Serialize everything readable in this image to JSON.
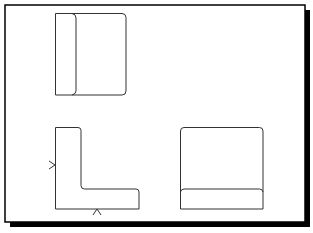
{
  "drawing": {
    "type": "orthographic-projection",
    "frame": {
      "x": 5,
      "y": 5,
      "width": 300,
      "height": 217,
      "shadow_offset": 5,
      "border_color": "#000000",
      "shadow_color": "#000000",
      "background": "#ffffff"
    },
    "line_color": "#333333",
    "views": [
      {
        "name": "top-view",
        "outline": {
          "x": 55,
          "y": 13,
          "width": 71,
          "height": 82
        },
        "divider_x": 75
      },
      {
        "name": "front-view",
        "shape": "L",
        "points": [
          [
            55,
            127
          ],
          [
            79,
            127
          ],
          [
            81,
            129
          ],
          [
            81,
            187
          ],
          [
            83,
            189
          ],
          [
            137,
            189
          ],
          [
            139,
            191
          ],
          [
            139,
            209
          ],
          [
            55,
            209
          ]
        ]
      },
      {
        "name": "side-view",
        "outline": {
          "x": 180,
          "y": 127,
          "width": 83,
          "height": 82
        },
        "divider_y": 189
      }
    ],
    "view_arrows": [
      {
        "name": "left-view-arrow",
        "direction": "right",
        "apex": [
          55,
          165
        ]
      },
      {
        "name": "bottom-view-arrow",
        "direction": "up",
        "apex": [
          97,
          209
        ]
      }
    ]
  }
}
